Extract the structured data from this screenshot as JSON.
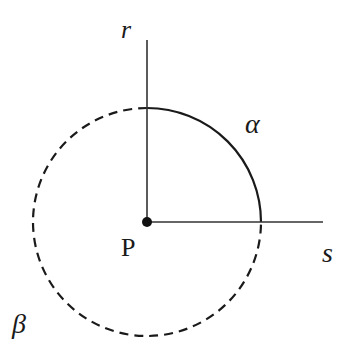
{
  "diagram": {
    "labels": {
      "vertical_ray": "r",
      "horizontal_ray": "s",
      "point": "P",
      "solid_arc": "α",
      "dashed_arc": "β"
    },
    "colors": {
      "stroke": "#1a1a1a",
      "background": "#ffffff"
    },
    "geometry": {
      "center": [
        147,
        222
      ],
      "radius": 114,
      "solid_arc": "quarter circle from r-ray to s-ray (upper-right quadrant)",
      "dashed_arc": "remaining three-quarter circle"
    }
  }
}
